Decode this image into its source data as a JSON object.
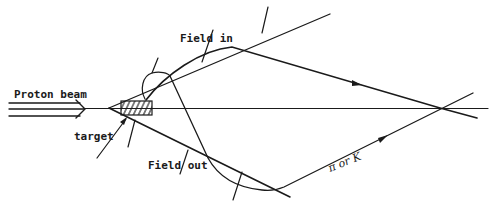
{
  "figure": {
    "labels": {
      "proton_beam": "Proton beam",
      "target": "target",
      "field_in": "Field in",
      "field_out": "Field out",
      "particle": "π or K"
    },
    "colors": {
      "background": "#ffffff",
      "ink": "#1a1a1a"
    }
  }
}
